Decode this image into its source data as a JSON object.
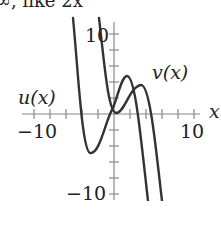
{
  "caption": "∞, like 2x",
  "chart_data": {
    "type": "line",
    "title": "",
    "xlabel": "x",
    "ylabel": "",
    "xlim": [
      -10,
      10
    ],
    "ylim": [
      -10,
      10
    ],
    "x_tick_labels": [
      "−10",
      "10"
    ],
    "y_tick_labels": [
      "10",
      "−10"
    ],
    "x_ticks": [
      -10,
      -8,
      -6,
      -4,
      -2,
      2,
      4,
      6,
      8,
      10
    ],
    "y_ticks": [
      -10,
      -8,
      -6,
      -4,
      -2,
      2,
      4,
      6,
      8,
      10
    ],
    "grid": false,
    "series": [
      {
        "name": "u(x)",
        "points": [
          [
            -5.0,
            12.0
          ],
          [
            -4.2,
            2.0
          ],
          [
            -3.4,
            -4.8
          ],
          [
            -2.0,
            -2.5
          ],
          [
            0.0,
            1.5
          ],
          [
            1.4,
            4.75
          ],
          [
            2.5,
            2.0
          ],
          [
            4.1,
            -11.0
          ]
        ],
        "color": "#333333"
      },
      {
        "name": "v(x)",
        "points": [
          [
            -1.8,
            12.0
          ],
          [
            -0.5,
            3.0
          ],
          [
            0.2,
            0.1
          ],
          [
            1.5,
            1.0
          ],
          [
            3.4,
            3.6
          ],
          [
            4.6,
            0.0
          ],
          [
            6.0,
            -11.0
          ]
        ],
        "color": "#333333"
      }
    ],
    "legend_labels": [
      "u(x)",
      "v(x)"
    ]
  },
  "labels": {
    "u": "u(x)",
    "v": "v(x)",
    "x_axis": "x",
    "x_min": "−10",
    "x_max": "10",
    "y_max": "10",
    "y_min": "−10"
  },
  "colors": {
    "curve": "#333333",
    "axis": "#8a8a8a",
    "text": "#222222"
  }
}
